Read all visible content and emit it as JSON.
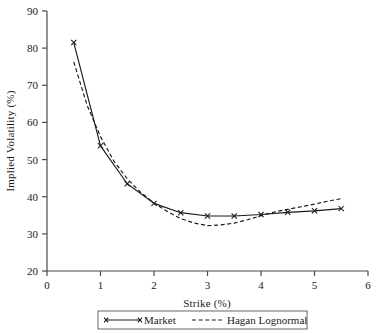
{
  "chart_data": {
    "type": "line",
    "title": "",
    "xlabel": "Strike (%)",
    "ylabel": "Implied Volatility (%)",
    "xlim": [
      0,
      6
    ],
    "ylim": [
      20,
      90
    ],
    "xticks": [
      "0",
      "1",
      "2",
      "3",
      "4",
      "5",
      "6"
    ],
    "yticks": [
      "20",
      "30",
      "40",
      "50",
      "60",
      "70",
      "80",
      "90"
    ],
    "xtick_values": [
      0,
      1,
      2,
      3,
      4,
      5,
      6
    ],
    "ytick_values": [
      20,
      30,
      40,
      50,
      60,
      70,
      80,
      90
    ],
    "grid": false,
    "legend_position": "below-axes",
    "series": [
      {
        "name": "Market",
        "style": "solid",
        "marker": "x",
        "color": "#1a1a1a",
        "x": [
          0.5,
          1.0,
          1.5,
          2.0,
          2.5,
          3.0,
          3.5,
          4.0,
          4.5,
          5.0,
          5.5
        ],
        "values": [
          81.5,
          53.7,
          43.5,
          38.2,
          35.7,
          34.8,
          34.8,
          35.2,
          35.8,
          36.2,
          36.8
        ]
      },
      {
        "name": "Hagan Lognormal",
        "style": "dashed",
        "marker": "none",
        "color": "#1a1a1a",
        "x": [
          0.5,
          0.75,
          1.0,
          1.25,
          1.5,
          1.75,
          2.0,
          2.25,
          2.5,
          2.75,
          3.0,
          3.25,
          3.5,
          3.75,
          4.0,
          4.25,
          4.5,
          4.75,
          5.0,
          5.25,
          5.5
        ],
        "values": [
          76.3,
          64.6,
          56.2,
          49.6,
          44.8,
          41.2,
          38.3,
          36.0,
          34.1,
          32.9,
          32.2,
          32.4,
          32.9,
          33.8,
          34.9,
          35.9,
          36.6,
          37.3,
          38.0,
          38.8,
          39.5
        ]
      }
    ]
  },
  "legend": {
    "items": [
      {
        "label": "Market",
        "style": "solid-marker"
      },
      {
        "label": "Hagan Lognormal",
        "style": "dashed"
      }
    ]
  }
}
